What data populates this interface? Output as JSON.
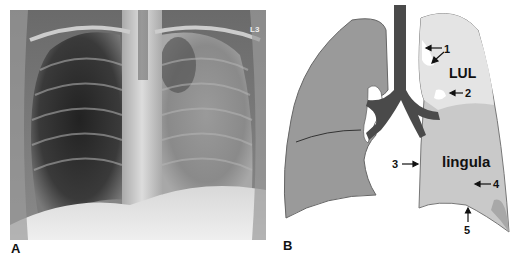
{
  "figure": {
    "panel_a": {
      "label": "A",
      "description": "Frontal chest radiograph showing left upper lobe / lingula opacity",
      "marker_text": "L3"
    },
    "panel_b": {
      "label": "B",
      "description": "Schematic of lungs and airways with left upper lobe collapse",
      "region_labels": {
        "lul": "LUL",
        "lingula": "lingula"
      },
      "arrows": [
        {
          "number": "1"
        },
        {
          "number": "2"
        },
        {
          "number": "3"
        },
        {
          "number": "4"
        },
        {
          "number": "5"
        }
      ]
    }
  }
}
